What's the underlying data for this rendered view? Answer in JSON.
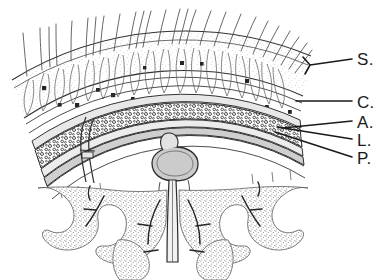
{
  "figure": {
    "kind": "anatomical-line-drawing",
    "background_color": "#ffffff",
    "ink_color": "#1a1a1a",
    "line_color": "#3a3a3a",
    "tint_color": "#c9c9c9",
    "stipple_color": "#707070"
  },
  "labels": [
    {
      "id": "S",
      "text": "S.",
      "meaning": "skin-and-superficial-fascia",
      "x": 357,
      "y": 51
    },
    {
      "id": "C",
      "text": "C.",
      "meaning": "cranium-bone",
      "x": 357,
      "y": 94
    },
    {
      "id": "A",
      "text": "A.",
      "meaning": "arachnoid-mater",
      "x": 357,
      "y": 114
    },
    {
      "id": "L",
      "text": "L.",
      "meaning": "leptomeninx-subarachnoid",
      "x": 357,
      "y": 132
    },
    {
      "id": "P",
      "text": "P.",
      "meaning": "pia-mater",
      "x": 357,
      "y": 150
    }
  ],
  "leaders": [
    {
      "id": "S",
      "from_x": 352,
      "from_y": 59,
      "to_x": 307,
      "to_y": 66,
      "elbow_x": 304,
      "elbow_y": 60
    },
    {
      "id": "C",
      "from_x": 352,
      "from_y": 101,
      "to_x": 296,
      "to_y": 101
    },
    {
      "id": "A",
      "from_x": 352,
      "from_y": 121,
      "to_x": 283,
      "to_y": 128
    },
    {
      "id": "L",
      "from_x": 352,
      "from_y": 139,
      "to_x": 276,
      "to_y": 128
    },
    {
      "id": "P",
      "from_x": 352,
      "from_y": 157,
      "to_x": 274,
      "to_y": 133
    }
  ],
  "structures": {
    "scalp_hairs_count": 26,
    "hair_follicles_count": 11,
    "brain_gyri_count": 7,
    "skull_layers": [
      "outer-table",
      "diploe",
      "inner-table"
    ],
    "meningeal_layers": [
      "dura-mater",
      "arachnoid",
      "subarachnoid-space",
      "pia-mater"
    ],
    "midline_structures": [
      "superior-sagittal-sinus",
      "falx-cerebri",
      "longitudinal-fissure"
    ],
    "vessels": [
      "emissary-vein",
      "cortical-artery",
      "cortical-vein"
    ]
  },
  "geometry": {
    "arc_center_x": 172,
    "arc_center_y": 392,
    "radius_skin_outer": 330,
    "radius_skin_inner": 292,
    "radius_skull_outer": 268,
    "radius_diploe_outer": 262,
    "radius_diploe_inner": 246,
    "radius_skull_inner": 240,
    "radius_dura": 232,
    "span_start_deg": -148,
    "span_end_deg": -34
  }
}
